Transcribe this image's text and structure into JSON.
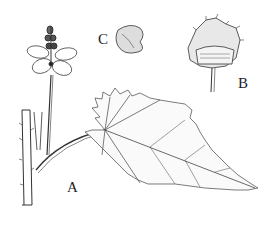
{
  "figure": {
    "type": "botanical-line-drawing",
    "labels": {
      "a": "A",
      "b": "B",
      "c": "C"
    },
    "panels": [
      {
        "label": "A",
        "description": "stem with inflorescence and serrate cordate leaf on long petiole"
      },
      {
        "label": "B",
        "description": "fruit capsule with spiny valves on pedicel"
      },
      {
        "label": "C",
        "description": "seed"
      }
    ],
    "colors": {
      "ink": "#222222",
      "background": "#ffffff"
    }
  }
}
